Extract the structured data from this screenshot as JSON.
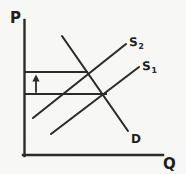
{
  "figure": {
    "kind": "hand-drawn-economics-diagram",
    "background_color": "#f7f7f5",
    "ink_color": "#2b2b2b",
    "width": 186,
    "height": 174
  },
  "axes": {
    "vertical": {
      "label": "P",
      "name": "price-axis",
      "x": 24,
      "y_top": 20,
      "y_bottom": 156
    },
    "horizontal": {
      "label": "Q",
      "name": "quantity-axis",
      "y": 155,
      "x_left": 23,
      "x_right": 163
    }
  },
  "curves": [
    {
      "id": "demand",
      "label": "D",
      "kind": "demand",
      "slope": "downward",
      "x1": 62,
      "y1": 36,
      "x2": 128,
      "y2": 131
    },
    {
      "id": "supply_2",
      "label": "S",
      "subscript": "2",
      "kind": "supply",
      "slope": "upward",
      "x1": 33,
      "y1": 118,
      "x2": 126,
      "y2": 44
    },
    {
      "id": "supply_1",
      "label": "S",
      "subscript": "1",
      "kind": "supply",
      "slope": "upward",
      "x1": 51,
      "y1": 134,
      "x2": 139,
      "y2": 67
    }
  ],
  "price_lines": [
    {
      "id": "price_high",
      "name": "price-line-upper",
      "y": 72,
      "x_from": 24,
      "x_to": 88,
      "meaning": "new higher equilibrium price at D x S2"
    },
    {
      "id": "price_low",
      "name": "price-line-lower",
      "y": 94,
      "x_from": 24,
      "x_to": 107,
      "meaning": "original equilibrium price at D x S1"
    }
  ],
  "annotations": [
    {
      "id": "price-increase-arrow",
      "glyph": "up-arrow",
      "direction": "up",
      "x": 36,
      "y_from": 92,
      "y_to": 76,
      "meaning": "price rises from lower to upper line"
    }
  ],
  "equilibria": [
    {
      "id": "eq_new",
      "x": 88,
      "y": 72,
      "curves": [
        "demand",
        "supply_2"
      ]
    },
    {
      "id": "eq_old",
      "x": 107,
      "y": 94,
      "curves": [
        "demand",
        "supply_1"
      ]
    }
  ],
  "labels": {
    "price_axis": "P",
    "quantity_axis": "Q",
    "demand": "D",
    "supply_shifted": "S",
    "supply_shifted_sub": "2",
    "supply_original": "S",
    "supply_original_sub": "1"
  }
}
